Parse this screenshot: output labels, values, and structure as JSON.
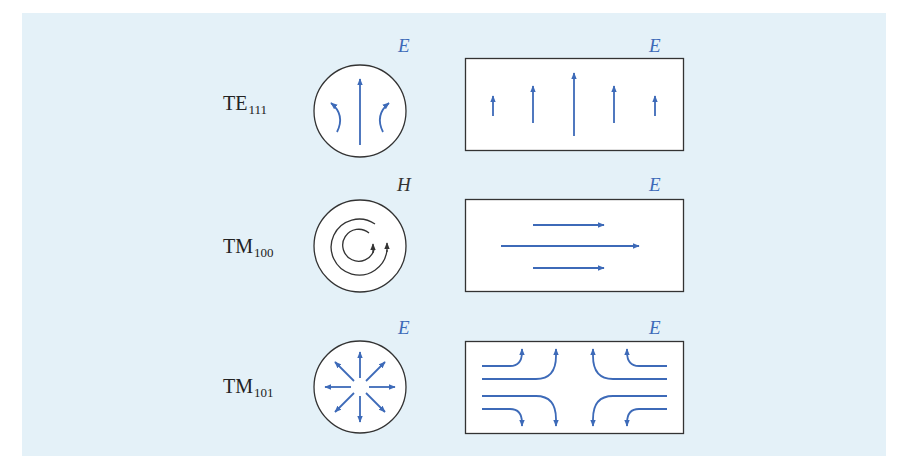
{
  "figure": {
    "background_color": "#e4f1f8",
    "field_color": "#3d6ab8",
    "outline_color": "#333333",
    "rows": [
      {
        "mode": {
          "base": "TE",
          "subscript": "111"
        },
        "cross_section": {
          "shape": "circle",
          "field_label": "E",
          "label_color": "#3d6ab8",
          "pattern": "one central upward arrow flanked by two curved arrows bending inward"
        },
        "side_view": {
          "shape": "rectangle",
          "field_label": "E",
          "pattern": "five vertical upward arrows, tallest in center"
        }
      },
      {
        "mode": {
          "base": "TM",
          "subscript": "100"
        },
        "cross_section": {
          "shape": "circle",
          "field_label": "H",
          "label_color": "#333333",
          "pattern": "two concentric circulating loops with arrowheads"
        },
        "side_view": {
          "shape": "rectangle",
          "field_label": "E",
          "pattern": "three horizontal rightward arrows, longest in middle"
        }
      },
      {
        "mode": {
          "base": "TM",
          "subscript": "101"
        },
        "cross_section": {
          "shape": "circle",
          "field_label": "E",
          "label_color": "#3d6ab8",
          "pattern": "eight radial outward arrows"
        },
        "side_view": {
          "shape": "rectangle",
          "field_label": "E",
          "pattern": "horizontal lines curving to top and bottom edges"
        }
      }
    ]
  }
}
